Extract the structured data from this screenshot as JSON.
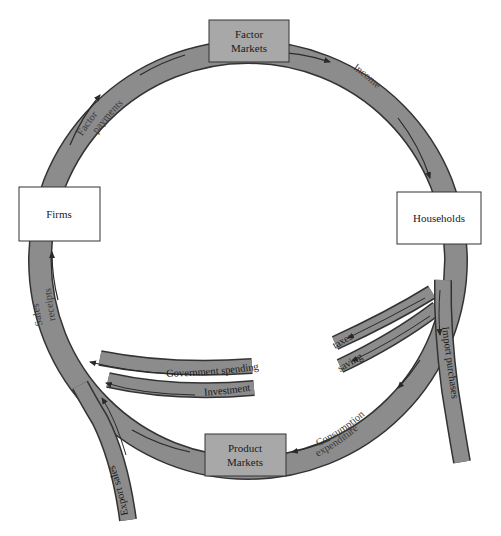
{
  "diagram": {
    "colors": {
      "band_fill": "#8c8c8c",
      "band_edge": "#333333",
      "arrow": "#2a2a2a",
      "market_box_fill": "#a8a8a8",
      "sector_box_fill": "#ffffff",
      "background": "#ffffff"
    },
    "nodes": {
      "factor_markets": {
        "line1": "Factor",
        "line2": "Markets"
      },
      "product_markets": {
        "line1": "Product",
        "line2": "Markets"
      },
      "firms": {
        "label": "Firms"
      },
      "households": {
        "label": "Households"
      }
    },
    "flows": {
      "factor_payments": {
        "line1": "Factor",
        "line2": "payments"
      },
      "income": {
        "label": "Income"
      },
      "consumption_expenditure": {
        "line1": "Consumption",
        "line2": "expenditure"
      },
      "sales_receipts": {
        "line1": "Sales",
        "line2": "receipts"
      }
    },
    "leakages": {
      "taxes": {
        "label": "taxes"
      },
      "saving": {
        "label": "saving"
      },
      "import_purchases": {
        "label": "Import purchases"
      }
    },
    "injections": {
      "government_spending": {
        "label": "Government spending"
      },
      "investment": {
        "label": "Investment"
      },
      "export_sales": {
        "label": "Export sales"
      }
    }
  }
}
